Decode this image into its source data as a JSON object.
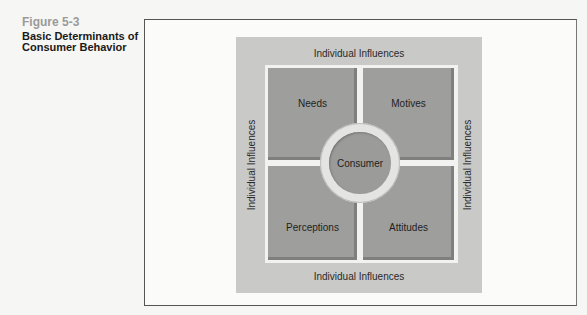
{
  "caption": {
    "figure_number": "Figure 5-3",
    "title": "Basic Determinants of Consumer Behavior"
  },
  "diagram": {
    "outer_labels": {
      "top": "Individual Influences",
      "bottom": "Individual Influences",
      "left": "Individual Influences",
      "right": "Individual Influences"
    },
    "quadrants": {
      "top_left": "Needs",
      "top_right": "Motives",
      "bottom_left": "Perceptions",
      "bottom_right": "Attitudes"
    },
    "center": "Consumer"
  },
  "colors": {
    "panel": "#c9c9c7",
    "quadrant": "#9e9e9c",
    "figure_number": "#9a9a9a"
  }
}
